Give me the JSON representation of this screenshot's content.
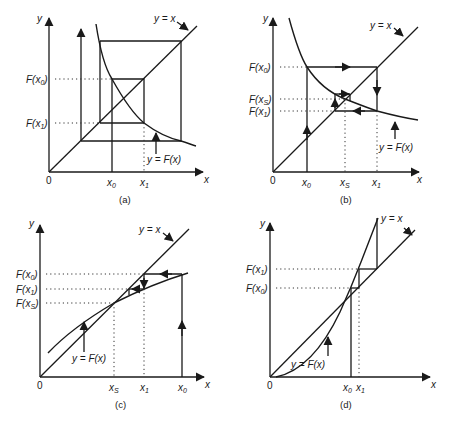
{
  "figure": {
    "panels": [
      {
        "id": "a",
        "caption": "(a)",
        "axis_x": "x",
        "axis_y": "y",
        "origin": "0",
        "x_ticks": [
          "x0",
          "x1"
        ],
        "y_ticks": [
          "F(x0)",
          "F(x1)"
        ],
        "label_identity": "y = x",
        "label_curve": "y = F(x)",
        "description": "Diverging cobweb: decreasing F, oscillation grows outward"
      },
      {
        "id": "b",
        "caption": "(b)",
        "axis_x": "x",
        "axis_y": "y",
        "origin": "0",
        "x_ticks": [
          "x0",
          "xS",
          "x1"
        ],
        "y_ticks": [
          "F(x0)",
          "F(xS)",
          "F(x1)"
        ],
        "label_identity": "y = x",
        "label_curve": "y = F(x)",
        "description": "Converging cobweb spiral toward fixed point xS"
      },
      {
        "id": "c",
        "caption": "(c)",
        "axis_x": "x",
        "axis_y": "y",
        "origin": "0",
        "x_ticks": [
          "xS",
          "x1",
          "x0"
        ],
        "y_ticks": [
          "F(x0)",
          "F(x1)",
          "F(xS)"
        ],
        "label_identity": "y = x",
        "label_curve": "y = F(x)",
        "description": "Monotone staircase converging to xS"
      },
      {
        "id": "d",
        "caption": "(d)",
        "axis_x": "x",
        "axis_y": "y",
        "origin": "0",
        "x_ticks": [
          "x0",
          "x1"
        ],
        "y_ticks": [
          "F(x1)",
          "F(x0)"
        ],
        "label_identity": "y = x",
        "label_curve": "y = F(x)",
        "description": "Monotone staircase diverging away from fixed point"
      }
    ]
  }
}
